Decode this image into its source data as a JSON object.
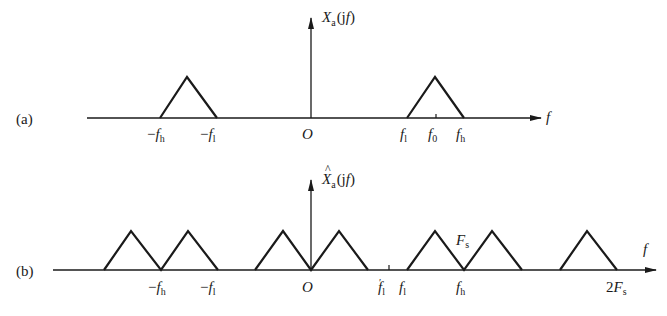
{
  "diagram": {
    "panels": [
      {
        "id": "a",
        "tag": "(a)",
        "ylabel": {
          "main": "X",
          "sub": "a",
          "arg": "(jf)",
          "hat": false
        },
        "xlabel": "f",
        "origin": "O",
        "ticks": [
          {
            "pre": "−",
            "main": "f",
            "sub": "h"
          },
          {
            "pre": "−",
            "main": "f",
            "sub": "l"
          },
          {
            "pre": "",
            "main": "f",
            "sub": "l"
          },
          {
            "pre": "",
            "main": "f",
            "sub": "0"
          },
          {
            "pre": "",
            "main": "f",
            "sub": "h"
          }
        ],
        "triangles": [
          {
            "name": "negative-band",
            "from": "-fh",
            "to": "-fl"
          },
          {
            "name": "positive-band",
            "from": "fl",
            "to": "fh",
            "center": "f0"
          }
        ]
      },
      {
        "id": "b",
        "tag": "(b)",
        "ylabel": {
          "main": "X",
          "sub": "a",
          "arg": "(jf)",
          "hat": true,
          "hat_glyph": "^"
        },
        "xlabel": "f",
        "origin": "O",
        "annotation": {
          "main": "F",
          "sub": "s"
        },
        "ticks": [
          {
            "pre": "−",
            "main": "f",
            "sub": "h"
          },
          {
            "pre": "−",
            "main": "f",
            "sub": "l"
          },
          {
            "pre": "",
            "main": "f",
            "sub": "l",
            "prime": "′"
          },
          {
            "pre": "",
            "main": "f",
            "sub": "l"
          },
          {
            "pre": "",
            "main": "f",
            "sub": "h"
          },
          {
            "pre": "2",
            "main": "F",
            "sub": "s"
          }
        ],
        "triangles_count": 7
      }
    ]
  }
}
